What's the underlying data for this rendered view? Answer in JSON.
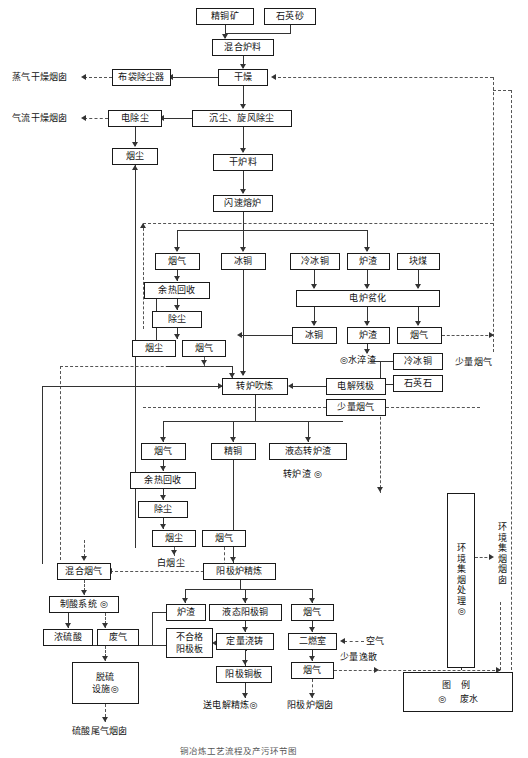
{
  "diagram": {
    "title": "铜冶炼工艺流程及产污环节图",
    "legend": {
      "header": "图  例",
      "symbol": "◎",
      "item": "废水"
    },
    "waste_marker": "◎"
  },
  "nodes": {
    "copper_concentrate": "精铜矿",
    "quartz_sand": "石英砂",
    "mixed_charge": "混合炉料",
    "drying": "干燥",
    "bag_filter": "布袋除尘器",
    "settle_cyclone": "沉尘、旋风除尘",
    "electro_precip": "电除尘",
    "dust_1": "烟尘",
    "dry_charge": "干炉料",
    "flash_furnace": "闪速熔炉",
    "fluegas_flash": "烟气",
    "matte_flash": "冰铜",
    "cold_matte_in": "冷冰铜",
    "slag_flash": "炉渣",
    "lump_coal": "块煤",
    "electric_furnace": "电炉贫化",
    "matte_ef": "冰铜",
    "slag_ef": "炉渣",
    "fluegas_ef": "烟气",
    "waste_heat_1": "余热回收",
    "dedust_1": "除尘",
    "dust_2": "烟尘",
    "fluegas_2": "烟气",
    "water_quenched_slag": "◎水淬渣",
    "cold_matte_2": "冷冰铜",
    "quartz_stone": "石英石",
    "small_fluegas_label": "少量烟气",
    "converter": "转炉吹炼",
    "electrolytic_scrap": "电解残极",
    "small_fluegas_box": "少量烟气",
    "fluegas_conv": "烟气",
    "blister_copper": "精铜",
    "liquid_conv_slag": "液态转炉渣",
    "converter_slag_out": "转炉渣 ◎",
    "waste_heat_2": "余热回收",
    "dedust_2": "除尘",
    "dust_3": "烟尘",
    "fluegas_3": "烟气",
    "white_dust": "白烟尘",
    "anode_refining": "阳极炉精炼",
    "mixed_fluegas": "混合烟气",
    "acid_system": "制酸系统 ◎",
    "conc_sulfuric_acid": "浓硫酸",
    "waste_gas": "废气",
    "desulfur_facility": "脱硫\n设施◎",
    "sulfuric_tail_stack": "硫酸尾气烟囱",
    "anode_slag": "炉渣",
    "liquid_anode_copper": "液态阳极铜",
    "quant_casting": "定量浇铸",
    "reject_anode_plate": "不合格\n阳极板",
    "anode_copper_plate": "阳极铜板",
    "send_to_electrolysis": "送电解精炼◎",
    "fluegas_anode": "烟气",
    "second_chamber": "二燃室",
    "air": "空气",
    "fluegas_anode_2": "烟气",
    "small_escape": "少量逸散",
    "anode_stack": "阳极炉烟囱",
    "env_collect_treat": "环境集烟处理◎",
    "env_collect_stack": "环境集烟烟囱",
    "steam_dry_stack": "蒸气干燥烟囱",
    "airflow_dry_stack": "气流干燥烟囱",
    "small_fluegas_right": "少量烟气"
  }
}
